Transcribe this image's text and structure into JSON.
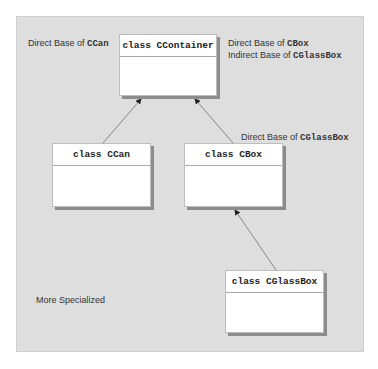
{
  "diagram": {
    "classes": [
      {
        "id": "ccontainer",
        "label": "class CContainer"
      },
      {
        "id": "ccan",
        "label": "class CCan"
      },
      {
        "id": "cbox",
        "label": "class CBox"
      },
      {
        "id": "cglassbox",
        "label": "class CGlassBox"
      }
    ],
    "annotations": {
      "ccan_base": {
        "prefix": "Direct Base of ",
        "code": "CCan"
      },
      "cbox_base": {
        "prefix": "Direct Base of ",
        "code": "CBox"
      },
      "cglassbox_indirect": {
        "prefix": "Indirect Base of ",
        "code": "CGlassBox"
      },
      "cglassbox_direct": {
        "prefix": "Direct Base of ",
        "code": "CGlassBox"
      },
      "more_specialized": "More Specialized"
    },
    "edges": [
      {
        "from": "ccan",
        "to": "ccontainer"
      },
      {
        "from": "cbox",
        "to": "ccontainer"
      },
      {
        "from": "cglassbox",
        "to": "cbox"
      }
    ]
  }
}
